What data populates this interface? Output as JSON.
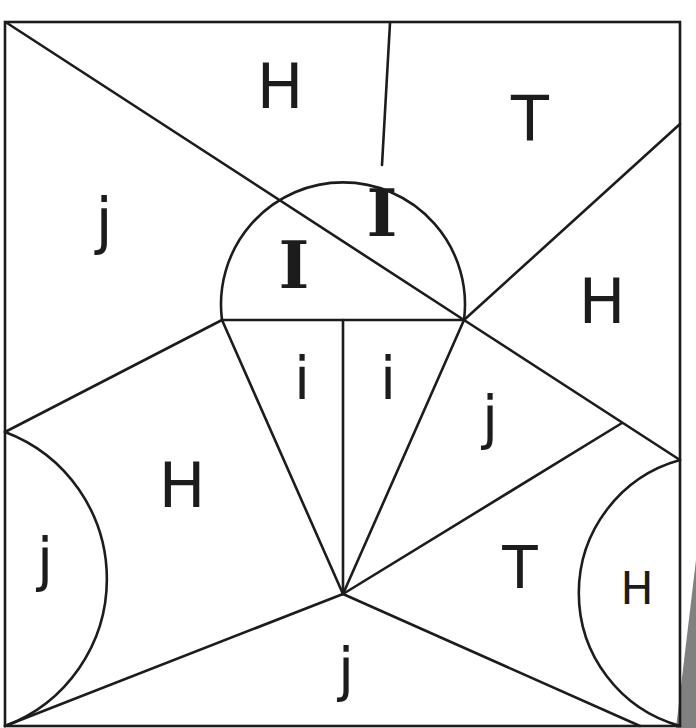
{
  "diagram": {
    "type": "letter-region puzzle",
    "regions": [
      {
        "id": "top-mid",
        "label": "H"
      },
      {
        "id": "top-right",
        "label": "T"
      },
      {
        "id": "left-upper",
        "label": "j"
      },
      {
        "id": "dome-left",
        "label": "I"
      },
      {
        "id": "dome-right",
        "label": "I"
      },
      {
        "id": "right-upper",
        "label": "H"
      },
      {
        "id": "cone-left",
        "label": "i"
      },
      {
        "id": "cone-right",
        "label": "i"
      },
      {
        "id": "right-middle",
        "label": "j"
      },
      {
        "id": "left-middle",
        "label": "H"
      },
      {
        "id": "left-arc",
        "label": "j"
      },
      {
        "id": "right-lower",
        "label": "T"
      },
      {
        "id": "right-arc",
        "label": "H"
      },
      {
        "id": "bottom",
        "label": "j"
      }
    ],
    "colors": {
      "line": "#1c1c1c",
      "background": "#ffffff",
      "shadow": "#808080"
    }
  }
}
